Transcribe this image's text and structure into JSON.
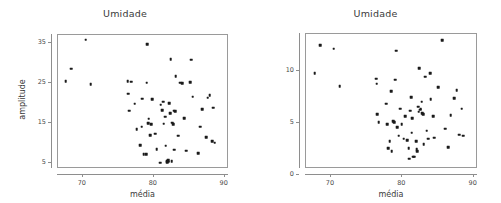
{
  "figure": {
    "background": "#ffffff",
    "point_color": "#1a1a1a",
    "axis_color": "#8e8e8e",
    "text_color": "#3a3a3a"
  },
  "panels": {
    "left": {
      "title": "Umidade",
      "xlabel": "média",
      "ylabel": "amplitude",
      "xticks": [
        "70",
        "80",
        "90"
      ],
      "yticks": [
        "5",
        "15",
        "25",
        "35"
      ]
    },
    "right": {
      "title": "Umidade",
      "xlabel": "média",
      "ylabel": "desvio padrão",
      "xticks": [
        "70",
        "80",
        "90"
      ],
      "yticks": [
        "0",
        "5",
        "10"
      ]
    }
  },
  "chart_data": [
    {
      "type": "scatter",
      "title": "Umidade",
      "xlabel": "média",
      "ylabel": "amplitude",
      "xlim": [
        66.5,
        90.6
      ],
      "ylim": [
        3.4,
        37.0
      ],
      "xticks": [
        70,
        80,
        90
      ],
      "yticks": [
        5,
        15,
        25,
        35
      ],
      "grid": false,
      "legend": "none",
      "n_points": 62,
      "points": [
        [
          67.6,
          25.4
        ],
        [
          68.4,
          28.5
        ],
        [
          70.4,
          35.8
        ],
        [
          71.1,
          24.6
        ],
        [
          76.3,
          25.4
        ],
        [
          76.4,
          22.3
        ],
        [
          76.5,
          18.0
        ],
        [
          77.3,
          19.8
        ],
        [
          77.6,
          13.4
        ],
        [
          78.1,
          9.3
        ],
        [
          78.3,
          14.0
        ],
        [
          78.4,
          21.0
        ],
        [
          78.6,
          7.1
        ],
        [
          78.9,
          7.1
        ],
        [
          79.0,
          25.0
        ],
        [
          79.1,
          34.7
        ],
        [
          79.2,
          14.9
        ],
        [
          79.3,
          16.0
        ],
        [
          79.5,
          11.9
        ],
        [
          79.6,
          14.6
        ],
        [
          80.2,
          12.3
        ],
        [
          80.4,
          8.4
        ],
        [
          80.9,
          5.0
        ],
        [
          81.0,
          19.5
        ],
        [
          81.2,
          18.2
        ],
        [
          81.3,
          20.3
        ],
        [
          81.4,
          14.8
        ],
        [
          81.6,
          16.5
        ],
        [
          81.7,
          9.2
        ],
        [
          81.8,
          5.4
        ],
        [
          82.0,
          5.6
        ],
        [
          82.1,
          5.2
        ],
        [
          82.2,
          19.9
        ],
        [
          82.3,
          17.4
        ],
        [
          82.4,
          31.0
        ],
        [
          82.5,
          5.3
        ],
        [
          82.6,
          15.0
        ],
        [
          82.7,
          14.7
        ],
        [
          82.9,
          8.2
        ],
        [
          83.1,
          26.6
        ],
        [
          83.4,
          11.7
        ],
        [
          83.7,
          25.0
        ],
        [
          84.0,
          24.9
        ],
        [
          84.3,
          16.1
        ],
        [
          84.6,
          8.0
        ],
        [
          85.1,
          25.1
        ],
        [
          85.3,
          30.8
        ],
        [
          85.5,
          21.5
        ],
        [
          86.3,
          7.3
        ],
        [
          86.5,
          14.0
        ],
        [
          86.8,
          18.4
        ],
        [
          87.4,
          11.4
        ],
        [
          87.6,
          21.3
        ],
        [
          87.9,
          21.9
        ],
        [
          88.2,
          10.4
        ],
        [
          88.4,
          18.8
        ],
        [
          88.6,
          10.0
        ],
        [
          76.8,
          25.3
        ],
        [
          79.8,
          20.9
        ],
        [
          82.8,
          18.0
        ],
        [
          83.0,
          17.9
        ],
        [
          81.9,
          5.1
        ]
      ]
    },
    {
      "type": "scatter",
      "title": "Umidade",
      "xlabel": "média",
      "ylabel": "desvio padrão",
      "xlim": [
        66.5,
        90.6
      ],
      "ylim": [
        0.6,
        13.6
      ],
      "xticks": [
        70,
        80,
        90
      ],
      "yticks": [
        0,
        5,
        10
      ],
      "grid": false,
      "legend": "none",
      "n_points": 62,
      "points": [
        [
          67.7,
          9.8
        ],
        [
          68.5,
          12.5
        ],
        [
          70.4,
          12.2
        ],
        [
          71.2,
          8.6
        ],
        [
          76.3,
          9.3
        ],
        [
          76.4,
          8.8
        ],
        [
          76.5,
          5.9
        ],
        [
          76.7,
          5.1
        ],
        [
          77.7,
          6.9
        ],
        [
          78.0,
          2.6
        ],
        [
          78.2,
          3.3
        ],
        [
          78.4,
          8.1
        ],
        [
          78.5,
          2.3
        ],
        [
          78.7,
          5.2
        ],
        [
          78.9,
          5.1
        ],
        [
          79.0,
          9.2
        ],
        [
          79.1,
          12.0
        ],
        [
          79.3,
          4.6
        ],
        [
          79.5,
          3.8
        ],
        [
          79.9,
          4.9
        ],
        [
          80.2,
          3.5
        ],
        [
          80.4,
          5.7
        ],
        [
          80.7,
          3.4
        ],
        [
          81.0,
          1.6
        ],
        [
          81.1,
          6.2
        ],
        [
          81.2,
          7.5
        ],
        [
          81.4,
          5.5
        ],
        [
          81.5,
          1.8
        ],
        [
          81.7,
          1.8
        ],
        [
          81.9,
          3.3
        ],
        [
          82.0,
          2.5
        ],
        [
          82.2,
          6.6
        ],
        [
          82.3,
          6.1
        ],
        [
          82.4,
          10.3
        ],
        [
          82.5,
          6.3
        ],
        [
          82.6,
          6.4
        ],
        [
          82.7,
          7.1
        ],
        [
          82.8,
          6.0
        ],
        [
          82.9,
          5.9
        ],
        [
          83.0,
          3.0
        ],
        [
          83.2,
          9.5
        ],
        [
          83.4,
          4.3
        ],
        [
          83.6,
          3.5
        ],
        [
          83.9,
          9.8
        ],
        [
          84.0,
          7.3
        ],
        [
          84.3,
          5.7
        ],
        [
          84.5,
          3.6
        ],
        [
          85.0,
          8.5
        ],
        [
          85.6,
          13.0
        ],
        [
          86.0,
          4.5
        ],
        [
          86.4,
          2.7
        ],
        [
          86.8,
          5.8
        ],
        [
          87.3,
          7.4
        ],
        [
          87.6,
          8.2
        ],
        [
          88.0,
          3.9
        ],
        [
          88.3,
          6.4
        ],
        [
          88.5,
          3.8
        ],
        [
          80.9,
          2.6
        ],
        [
          81.3,
          4.1
        ],
        [
          82.1,
          2.3
        ],
        [
          79.7,
          6.4
        ],
        [
          77.9,
          4.9
        ]
      ]
    }
  ]
}
